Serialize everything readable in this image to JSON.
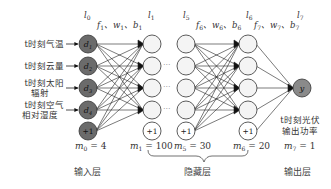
{
  "inputs": [
    {
      "line1": "t时刻气温",
      "line2": ""
    },
    {
      "line1": "t时刻云量",
      "line2": ""
    },
    {
      "line1": "t时刻太阳",
      "line2": "辐射"
    },
    {
      "line1": "t时刻空气",
      "line2": "相对湿度"
    }
  ],
  "input_nodes": [
    "d1",
    "d2",
    "d3",
    "d4",
    "+1"
  ],
  "bias_label": "+1",
  "output_node": "y",
  "output_label": {
    "line1": "t时刻光伏",
    "line2": "输出功率"
  },
  "layer_tags": {
    "l0": "l0",
    "l1": "l1",
    "l5": "l5",
    "l6": "l6",
    "l7": "l7"
  },
  "params": {
    "p1": "f1、w1、b1",
    "p6": "f6、w6、b6",
    "p7": "f7、w7、b7"
  },
  "m_labels": {
    "m0": "m0 = 4",
    "m1": "m1 = 100",
    "m5": "m5 = 30",
    "m6": "m6 = 20",
    "m7": "m7 = 1"
  },
  "layer_names": {
    "input": "输入层",
    "hidden": "隐藏层",
    "output": "输出层"
  },
  "ellipsis": "···",
  "colors": {
    "input_fill": "#6b6b6b",
    "hidden_fill": "#f4f4f4",
    "output_fill": "#8a8a8a",
    "line": "#222222"
  }
}
